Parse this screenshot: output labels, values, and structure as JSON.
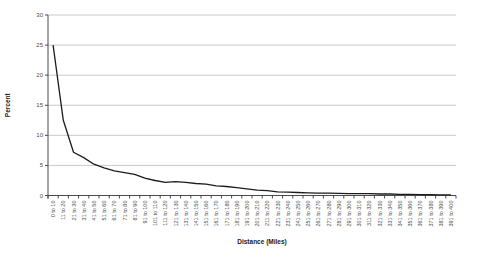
{
  "chart": {
    "y_axis_title": "Percent",
    "x_axis_title": "Distance (Miles)"
  },
  "chart_data": {
    "type": "line",
    "title": "",
    "xlabel": "Distance (Miles)",
    "ylabel": "Percent",
    "ylim": [
      0,
      30
    ],
    "yticks": [
      0,
      5,
      10,
      15,
      20,
      25,
      30
    ],
    "grid": true,
    "legend": "none",
    "line_color": "#1c1c1c",
    "gridline_color": "#bdbdbd",
    "axis_color": "#4a4a4a",
    "label_color": "#4d4d4d",
    "categories": [
      "0 to 10",
      "11 to 20",
      "21 to 30",
      "31 to 40",
      "41 to 50",
      "51 to 60",
      "61 to 70",
      "71 to 80",
      "81 to 90",
      "91 to 100",
      "101 to 110",
      "111 to 120",
      "121 to 130",
      "131 to 140",
      "141 to 150",
      "151 to 160",
      "161 to 170",
      "171 to 180",
      "181 to 190",
      "191 to 200",
      "201 to 210",
      "211 to 220",
      "221 to 230",
      "231 to 240",
      "241 to 250",
      "251 to 260",
      "261 to 270",
      "271 to 280",
      "281 to 290",
      "291 to 300",
      "301 to 310",
      "311 to 320",
      "321 to 330",
      "331 to 340",
      "341 to 350",
      "351 to 360",
      "361 to 370",
      "371 to 380",
      "381 to 390",
      "391 to 400"
    ],
    "values": [
      25,
      12.5,
      7.2,
      6.3,
      5.2,
      4.6,
      4.1,
      3.8,
      3.5,
      2.9,
      2.5,
      2.2,
      2.3,
      2.2,
      2.0,
      1.9,
      1.6,
      1.5,
      1.3,
      1.1,
      0.9,
      0.8,
      0.6,
      0.55,
      0.5,
      0.45,
      0.4,
      0.4,
      0.35,
      0.3,
      0.3,
      0.3,
      0.25,
      0.25,
      0.2,
      0.2,
      0.15,
      0.15,
      0.1,
      0.1
    ]
  }
}
